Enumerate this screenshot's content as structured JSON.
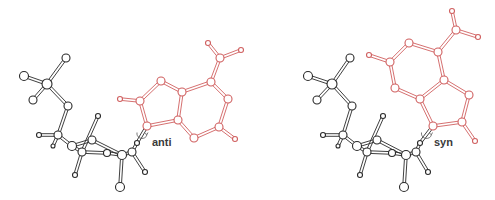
{
  "figure": {
    "panels": [
      {
        "id": "anti",
        "label": "anti",
        "label_pos": [
          152,
          136
        ],
        "base_color": "#d06060",
        "sugar_color": "#2a2a2a",
        "sugar_atoms": [
          [
            47,
            84,
            5
          ],
          [
            66,
            58,
            4
          ],
          [
            24,
            76,
            4.5
          ],
          [
            33,
            100,
            4
          ],
          [
            68,
            106,
            4
          ],
          [
            58,
            135,
            4
          ],
          [
            39,
            135,
            2.5
          ],
          [
            53,
            146,
            2
          ],
          [
            72,
            146,
            4.5
          ],
          [
            82,
            152,
            4
          ],
          [
            107,
            153,
            3.5
          ],
          [
            92,
            140,
            4
          ],
          [
            122,
            155,
            4.5
          ],
          [
            132,
            152,
            4
          ],
          [
            98,
            116,
            2.5
          ],
          [
            75,
            175,
            2.5
          ],
          [
            145,
            172,
            2.5
          ],
          [
            120,
            187,
            4.5
          ],
          [
            137,
            143,
            2.5
          ]
        ],
        "sugar_bonds": [
          [
            0,
            1
          ],
          [
            0,
            2
          ],
          [
            0,
            3
          ],
          [
            0,
            4
          ],
          [
            4,
            5
          ],
          [
            5,
            6
          ],
          [
            5,
            7
          ],
          [
            5,
            8
          ],
          [
            8,
            9
          ],
          [
            8,
            11
          ],
          [
            11,
            12
          ],
          [
            9,
            10
          ],
          [
            10,
            12
          ],
          [
            9,
            14
          ],
          [
            9,
            15
          ],
          [
            12,
            13
          ],
          [
            13,
            16
          ],
          [
            12,
            17
          ],
          [
            13,
            18
          ]
        ],
        "base_atoms": [
          [
            147,
            126,
            4
          ],
          [
            140,
            101,
            4
          ],
          [
            161,
            81,
            4
          ],
          [
            182,
            92,
            4
          ],
          [
            178,
            120,
            4
          ],
          [
            211,
            82,
            4
          ],
          [
            228,
            99,
            4
          ],
          [
            219,
            127,
            4
          ],
          [
            194,
            138,
            4
          ],
          [
            220,
            58,
            4
          ],
          [
            208,
            43,
            2.5
          ],
          [
            241,
            50,
            2.5
          ],
          [
            120,
            99,
            2.5
          ],
          [
            235,
            139,
            2.5
          ]
        ],
        "base_bonds": [
          [
            0,
            1
          ],
          [
            1,
            2
          ],
          [
            2,
            3
          ],
          [
            3,
            4
          ],
          [
            4,
            0
          ],
          [
            3,
            5
          ],
          [
            5,
            6
          ],
          [
            6,
            7
          ],
          [
            7,
            8
          ],
          [
            8,
            4
          ],
          [
            5,
            9
          ],
          [
            9,
            10
          ],
          [
            9,
            11
          ],
          [
            1,
            12
          ],
          [
            7,
            13
          ]
        ],
        "link_bond": [
          [
            137,
            143
          ],
          [
            147,
            126
          ]
        ]
      },
      {
        "id": "syn",
        "label": "syn",
        "label_pos": [
          434,
          136
        ],
        "base_color": "#d06060",
        "sugar_color": "#2a2a2a",
        "sugar_atoms": [
          [
            332,
            84,
            5
          ],
          [
            350,
            58,
            4
          ],
          [
            308,
            76,
            4.5
          ],
          [
            317,
            100,
            4
          ],
          [
            352,
            106,
            4
          ],
          [
            343,
            135,
            4
          ],
          [
            323,
            135,
            2.5
          ],
          [
            338,
            146,
            2
          ],
          [
            357,
            146,
            4.5
          ],
          [
            367,
            152,
            4
          ],
          [
            392,
            153,
            3.5
          ],
          [
            377,
            140,
            4
          ],
          [
            406,
            155,
            4.5
          ],
          [
            416,
            152,
            4
          ],
          [
            383,
            116,
            2.5
          ],
          [
            360,
            175,
            2.5
          ],
          [
            428,
            172,
            2.5
          ],
          [
            404,
            187,
            4.5
          ],
          [
            420,
            143,
            2.5
          ]
        ],
        "sugar_bonds": [
          [
            0,
            1
          ],
          [
            0,
            2
          ],
          [
            0,
            3
          ],
          [
            0,
            4
          ],
          [
            4,
            5
          ],
          [
            5,
            6
          ],
          [
            5,
            7
          ],
          [
            5,
            8
          ],
          [
            8,
            9
          ],
          [
            8,
            11
          ],
          [
            11,
            12
          ],
          [
            9,
            10
          ],
          [
            10,
            12
          ],
          [
            9,
            14
          ],
          [
            9,
            15
          ],
          [
            12,
            13
          ],
          [
            13,
            16
          ],
          [
            12,
            17
          ],
          [
            13,
            18
          ]
        ],
        "base_atoms": [
          [
            433,
            126,
            4
          ],
          [
            462,
            122,
            4
          ],
          [
            469,
            95,
            4
          ],
          [
            444,
            80,
            4
          ],
          [
            420,
            99,
            4
          ],
          [
            395,
            88,
            4
          ],
          [
            390,
            62,
            4
          ],
          [
            409,
            43,
            4
          ],
          [
            438,
            52,
            4
          ],
          [
            456,
            30,
            4
          ],
          [
            452,
            11,
            2.5
          ],
          [
            478,
            37,
            2.5
          ],
          [
            369,
            55,
            2.5
          ],
          [
            475,
            141,
            2.5
          ]
        ],
        "base_bonds": [
          [
            0,
            1
          ],
          [
            1,
            2
          ],
          [
            2,
            3
          ],
          [
            3,
            4
          ],
          [
            4,
            0
          ],
          [
            4,
            5
          ],
          [
            5,
            6
          ],
          [
            6,
            7
          ],
          [
            7,
            8
          ],
          [
            8,
            3
          ],
          [
            8,
            9
          ],
          [
            9,
            10
          ],
          [
            9,
            11
          ],
          [
            6,
            12
          ],
          [
            1,
            13
          ]
        ],
        "link_bond": [
          [
            420,
            143
          ],
          [
            433,
            126
          ]
        ]
      }
    ]
  }
}
